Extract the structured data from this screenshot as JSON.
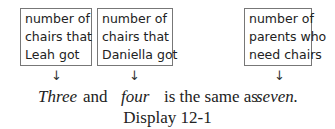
{
  "boxes": [
    {
      "lines": [
        "number of",
        "chairs that",
        "Leah got"
      ]
    },
    {
      "lines": [
        "number of",
        "chairs that",
        "Daniella got"
      ]
    },
    {
      "lines": [
        "number of",
        "parents who",
        "need chairs"
      ]
    }
  ],
  "arrow_glyph": "↓",
  "sentence": {
    "w1": "Three",
    "w2": "and",
    "w3": "four",
    "w4": "is the same as",
    "w5": "seven."
  },
  "caption": "Display 12-1"
}
